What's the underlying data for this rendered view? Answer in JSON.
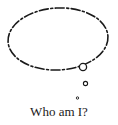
{
  "illustration": {
    "type": "thought-bubble",
    "stroke_color": "#1a1a1a",
    "background_color": "#ffffff"
  },
  "caption": {
    "text": "Who am I?"
  }
}
